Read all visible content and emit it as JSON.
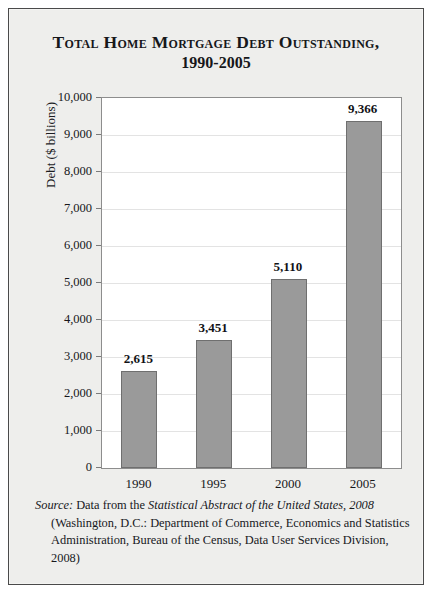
{
  "chart_data": {
    "type": "bar",
    "title": "Total Home Mortgage Debt Outstanding,",
    "subtitle": "1990-2005",
    "categories": [
      "1990",
      "1995",
      "2000",
      "2005"
    ],
    "values": [
      2615,
      3451,
      5110,
      9366
    ],
    "value_labels": [
      "2,615",
      "3,451",
      "5,110",
      "9,366"
    ],
    "xlabel": "",
    "ylabel": "Debt ($ billions)",
    "ylim": [
      0,
      10000
    ],
    "ytick_step": 1000,
    "ytick_labels": [
      "10,000",
      "9,000",
      "8,000",
      "7,000",
      "6,000",
      "5,000",
      "4,000",
      "3,000",
      "2,000",
      "1,000",
      "0"
    ],
    "grid": true,
    "legend": "none",
    "bar_color": "#9a9a9a",
    "bar_edge_color": "#6f6f6f",
    "plot_background": "#ffffff",
    "figure_background": "#eeeeec",
    "gridline_color": "#e3e3e3"
  },
  "source": {
    "label": "Source:",
    "text_before_pub": " Data from the ",
    "publication": "Statistical Abstract of the United States, 2008",
    "text_after_pub": " (Washington, D.C.: Department of Commerce, Economics and Statistics Administration, Bureau of the Census, Data User Services Division, 2008)"
  }
}
